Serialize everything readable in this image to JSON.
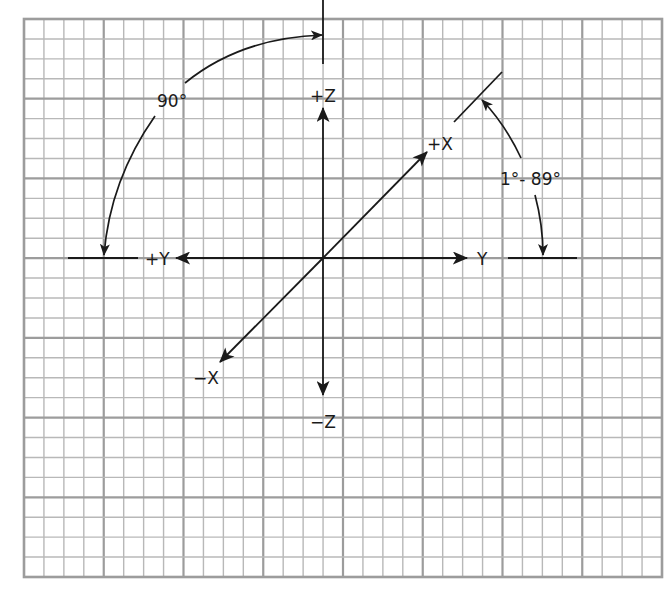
{
  "diagram": {
    "type": "3d-axis-orientation",
    "grid": {
      "x0": 24,
      "y0": 19,
      "x1": 662,
      "y1": 577,
      "minor_step": 20,
      "major_every": 4,
      "minor_color": "#b8b8b8",
      "major_color": "#9c9c9c"
    },
    "origin": {
      "x": 323,
      "y": 258
    },
    "axes": {
      "pos_z": "+Z",
      "neg_z": "−Z",
      "pos_y": "+Y",
      "neg_y": "Y",
      "pos_x": "+X",
      "neg_x": "−X"
    },
    "angles": {
      "left": "90°",
      "right": "1°- 89°"
    },
    "ink_color": "#1a1a1a"
  }
}
